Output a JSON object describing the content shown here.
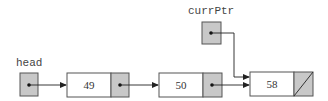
{
  "diagram": {
    "type": "linked-list",
    "colors": {
      "pointer_fill": "#c8c8c8",
      "data_fill": "#ffffff",
      "stroke": "#555555",
      "arrow": "#222222"
    },
    "pointers": [
      {
        "name": "head",
        "label": "head",
        "points_to": 0
      },
      {
        "name": "currPtr",
        "label": "currPtr",
        "points_to": 2
      }
    ],
    "nodes": [
      {
        "value": "49",
        "next": 1
      },
      {
        "value": "50",
        "next": 2
      },
      {
        "value": "58",
        "next": null
      }
    ]
  }
}
